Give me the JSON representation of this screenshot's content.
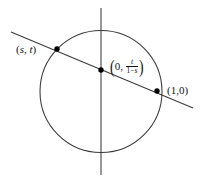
{
  "figure": {
    "canvas": {
      "width": 203,
      "height": 182,
      "background": "#ffffff"
    },
    "stroke_color": "#333333",
    "point_color": "#000000",
    "text_color": "#121212",
    "geometry": {
      "circle": {
        "cx": 101,
        "cy": 91.5,
        "r": 61
      },
      "vertical_axis": {
        "x": 101,
        "y1": 8,
        "y2": 175
      },
      "secant_line": {
        "x1": 11,
        "y1": 32,
        "x2": 193,
        "y2": 108
      }
    },
    "points": [
      {
        "name": "point-s-t",
        "cx": 57,
        "cy": 49
      },
      {
        "name": "point-intercept",
        "cx": 101,
        "cy": 70
      },
      {
        "name": "point-one-zero",
        "cx": 157,
        "cy": 91
      }
    ],
    "labels": {
      "point_st": {
        "paren_left": "(",
        "x": "s",
        "comma": ",",
        "y": "t",
        "paren_right": ")"
      },
      "y_intercept": {
        "paren_left": "(",
        "zero": "0,",
        "numerator": "t",
        "denominator_one": "1",
        "denominator_minus": "−",
        "denominator_s": "s",
        "paren_right": ")"
      },
      "point_one_zero": {
        "paren_left": "(",
        "x": "1",
        "comma": ",",
        "y": "0",
        "paren_right": ")"
      }
    }
  }
}
